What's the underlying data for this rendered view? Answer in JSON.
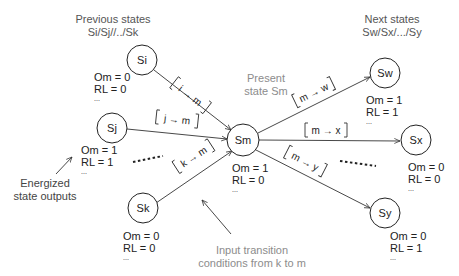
{
  "headers": {
    "previous_line1": "Previous states",
    "previous_line2": "Si/Sj//../Sk",
    "next_line1": "Next states",
    "next_line2": "Sw/Sx/.../Sy",
    "present_line1": "Present",
    "present_line2": "state Sm"
  },
  "states": {
    "si": {
      "label": "Si",
      "om": "Om = 0",
      "rl": "RL = 0",
      "more": "..."
    },
    "sj": {
      "label": "Sj",
      "om": "Om = 1",
      "rl": "RL = 1",
      "more": "..."
    },
    "sk": {
      "label": "Sk",
      "om": "Om = 0",
      "rl": "RL = 0",
      "more": "..."
    },
    "sm": {
      "label": "Sm",
      "om": "Om = 1",
      "rl": "RL = 0",
      "more": "..."
    },
    "sw": {
      "label": "Sw",
      "om": "Om = 1",
      "rl": "RL = 1",
      "more": "..."
    },
    "sx": {
      "label": "Sx",
      "om": "Om = 0",
      "rl": "RL = 0",
      "more": "..."
    },
    "sy": {
      "label": "Sy",
      "om": "Om = 0",
      "rl": "RL = 1",
      "more": "..."
    }
  },
  "transitions": {
    "i_m": "i → m",
    "j_m": "j → m",
    "k_m": "k → m",
    "m_w": "m → w",
    "m_x": "m → x",
    "m_y": "m → y"
  },
  "annotations": {
    "energized_line1": "Energized",
    "energized_line2": "state outputs",
    "input_line1": "Input transition",
    "input_line2": "conditions from k to m"
  }
}
